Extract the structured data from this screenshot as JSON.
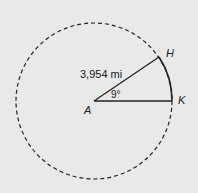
{
  "diagram": {
    "labels": {
      "center": "A",
      "point_h": "H",
      "point_k": "K",
      "radius": "3,954 mi",
      "angle": "9°"
    },
    "colors": {
      "background": "#e9e9e9",
      "line": "#222222"
    }
  }
}
